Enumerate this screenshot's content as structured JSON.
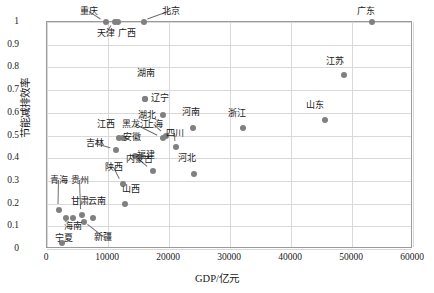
{
  "chart_data": {
    "type": "scatter",
    "title": "",
    "xlabel": "GDP/亿元",
    "ylabel": "节能减排效率",
    "xlim": [
      0,
      60000
    ],
    "ylim": [
      0,
      1
    ],
    "xticks": [
      "0",
      "10000",
      "20000",
      "30000",
      "40000",
      "50000",
      "60000"
    ],
    "yticks": [
      "0",
      "0.1",
      "0.2",
      "0.3",
      "0.4",
      "0.5",
      "0.6",
      "0.7",
      "0.8",
      "0.9",
      "1"
    ],
    "grid": true,
    "legend": "none",
    "marker_color": "#808080",
    "points": [
      {
        "label": "重庆",
        "x": 9700,
        "y": 1.0,
        "lx": 7100,
        "ly": 1.045,
        "leader": true
      },
      {
        "label": "天津",
        "x": 11100,
        "y": 1.0,
        "lx": 9900,
        "ly": 0.945,
        "leader": true
      },
      {
        "label": "广西",
        "x": 11700,
        "y": 1.0,
        "lx": 13300,
        "ly": 0.945,
        "leader": false
      },
      {
        "label": "北京",
        "x": 15900,
        "y": 1.0,
        "lx": 20500,
        "ly": 1.045,
        "leader": true
      },
      {
        "label": "广东",
        "x": 53200,
        "y": 1.0,
        "lx": 52400,
        "ly": 1.045,
        "leader": false
      },
      {
        "label": "江苏",
        "x": 48700,
        "y": 0.765,
        "lx": 47400,
        "ly": 0.825,
        "leader": false
      },
      {
        "label": "山东",
        "x": 45600,
        "y": 0.57,
        "lx": 44100,
        "ly": 0.63,
        "leader": false
      },
      {
        "label": "浙江",
        "x": 32100,
        "y": 0.535,
        "lx": 31300,
        "ly": 0.595,
        "leader": false
      },
      {
        "label": "湖南",
        "x": 16100,
        "y": 0.66,
        "lx": 16400,
        "ly": 0.77,
        "leader": false
      },
      {
        "label": "辽宁",
        "x": 16100,
        "y": 0.66,
        "lx": 18700,
        "ly": 0.66,
        "leader": false
      },
      {
        "label": "河南",
        "x": 23900,
        "y": 0.535,
        "lx": 23700,
        "ly": 0.6,
        "leader": false
      },
      {
        "label": "湖北",
        "x": 19000,
        "y": 0.59,
        "lx": 16600,
        "ly": 0.585,
        "leader": false
      },
      {
        "label": "上海",
        "x": 19500,
        "y": 0.5,
        "lx": 17700,
        "ly": 0.545,
        "leader": true
      },
      {
        "label": "四川",
        "x": 21200,
        "y": 0.45,
        "lx": 21100,
        "ly": 0.508,
        "leader": true
      },
      {
        "label": "黑龙江",
        "x": 19000,
        "y": 0.49,
        "lx": 14700,
        "ly": 0.548,
        "leader": true
      },
      {
        "label": "江西",
        "x": 11800,
        "y": 0.49,
        "lx": 9900,
        "ly": 0.548,
        "leader": false
      },
      {
        "label": "安徽",
        "x": 12500,
        "y": 0.49,
        "lx": 14100,
        "ly": 0.488,
        "leader": false
      },
      {
        "label": "吉林",
        "x": 11300,
        "y": 0.438,
        "lx": 8000,
        "ly": 0.462,
        "leader": true
      },
      {
        "label": "福建",
        "x": 14500,
        "y": 0.408,
        "lx": 16400,
        "ly": 0.408,
        "leader": false
      },
      {
        "label": "内蒙古",
        "x": 17300,
        "y": 0.345,
        "lx": 15300,
        "ly": 0.39,
        "leader": true
      },
      {
        "label": "河北",
        "x": 24100,
        "y": 0.33,
        "lx": 23100,
        "ly": 0.395,
        "leader": false
      },
      {
        "label": "陕西",
        "x": 12400,
        "y": 0.288,
        "lx": 11100,
        "ly": 0.358,
        "leader": true
      },
      {
        "label": "山西",
        "x": 12800,
        "y": 0.2,
        "lx": 13900,
        "ly": 0.258,
        "leader": false
      },
      {
        "label": "贵州",
        "x": 5800,
        "y": 0.148,
        "lx": 5600,
        "ly": 0.298,
        "leader": true
      },
      {
        "label": "青海",
        "x": 2000,
        "y": 0.172,
        "lx": 2100,
        "ly": 0.298,
        "leader": true
      },
      {
        "label": "甘肃",
        "x": 4300,
        "y": 0.135,
        "lx": 5500,
        "ly": 0.205,
        "leader": false
      },
      {
        "label": "云南",
        "x": 7600,
        "y": 0.135,
        "lx": 8300,
        "ly": 0.205,
        "leader": false
      },
      {
        "label": "海南",
        "x": 3100,
        "y": 0.135,
        "lx": 4500,
        "ly": 0.098,
        "leader": false
      },
      {
        "label": "新疆",
        "x": 6000,
        "y": 0.118,
        "lx": 9300,
        "ly": 0.05,
        "leader": true
      },
      {
        "label": "宁夏",
        "x": 2400,
        "y": 0.028,
        "lx": 3000,
        "ly": 0.045,
        "leader": false
      }
    ]
  }
}
